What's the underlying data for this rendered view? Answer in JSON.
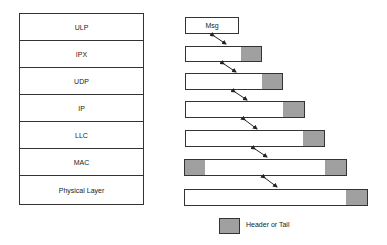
{
  "diagram": {
    "layers": [
      "ULP",
      "IPX",
      "UDP",
      "IP",
      "LLC",
      "MAC",
      "Physical Layer"
    ],
    "message_label": "Msg",
    "legend": {
      "label": "Header or Tail",
      "color": "#a0a0a0"
    },
    "encapsulation": [
      {
        "layer": "ULP",
        "segments": [
          "Msg"
        ]
      },
      {
        "layer": "IPX",
        "segments": [
          "data",
          "tail"
        ]
      },
      {
        "layer": "UDP",
        "segments": [
          "data",
          "tail"
        ]
      },
      {
        "layer": "IP",
        "segments": [
          "data",
          "tail"
        ]
      },
      {
        "layer": "LLC",
        "segments": [
          "data",
          "tail"
        ]
      },
      {
        "layer": "MAC",
        "segments": [
          "header",
          "data",
          "tail"
        ]
      },
      {
        "layer": "Physical Layer",
        "segments": [
          "data",
          "tail"
        ]
      }
    ]
  }
}
